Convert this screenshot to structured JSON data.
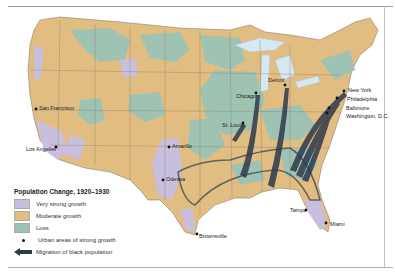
{
  "map": {
    "colors": {
      "very_strong_growth": "#c9bedd",
      "moderate_growth": "#e2bd82",
      "loss": "#9fc3b2",
      "water": "#d6e8f2",
      "border": "#7a7a6a",
      "migration_arrow": "#2e3a4e"
    },
    "cities": [
      {
        "name": "San Francisco",
        "x": 36,
        "y": 109
      },
      {
        "name": "Los Angeles",
        "x": 56,
        "y": 147
      },
      {
        "name": "Amarillo",
        "x": 169,
        "y": 147
      },
      {
        "name": "Odessa",
        "x": 163,
        "y": 180
      },
      {
        "name": "Brownsville",
        "x": 197,
        "y": 234
      },
      {
        "name": "Chicago",
        "x": 256,
        "y": 93
      },
      {
        "name": "Detroit",
        "x": 285,
        "y": 85
      },
      {
        "name": "St. Louis",
        "x": 243,
        "y": 123
      },
      {
        "name": "New York",
        "x": 344,
        "y": 91
      },
      {
        "name": "Philadelphia",
        "x": 337,
        "y": 98
      },
      {
        "name": "Baltimore",
        "x": 329,
        "y": 108
      },
      {
        "name": "Washington, D.C.",
        "x": 327,
        "y": 113
      },
      {
        "name": "Tampa",
        "x": 306,
        "y": 210
      },
      {
        "name": "Miami",
        "x": 326,
        "y": 223
      }
    ]
  },
  "legend": {
    "title": "Population Change, 1920–1930",
    "items": [
      {
        "label": "Very strong growth",
        "type": "swatch",
        "color": "#c9bedd"
      },
      {
        "label": "Moderate growth",
        "type": "swatch",
        "color": "#e2bd82"
      },
      {
        "label": "Loss",
        "type": "swatch",
        "color": "#9fc3b2"
      },
      {
        "label": "Urban areas of strong growth",
        "type": "dot"
      },
      {
        "label": "Migration of black population",
        "type": "arrow"
      }
    ]
  }
}
